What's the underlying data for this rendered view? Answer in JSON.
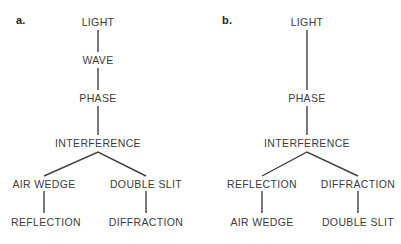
{
  "figure": {
    "type": "concept-tree-pair",
    "background_color": "#ffffff",
    "text_color": "#3c3c3c",
    "line_color": "#404040"
  },
  "panels": [
    {
      "label": "a.",
      "nodes": {
        "light": "LIGHT",
        "wave": "WAVE",
        "phase": "PHASE",
        "interference": "INTERFERENCE",
        "left_mid": "AIR WEDGE",
        "right_mid": "DOUBLE SLIT",
        "left_leaf": "REFLECTION",
        "right_leaf": "DIFFRACTION"
      }
    },
    {
      "label": "b.",
      "nodes": {
        "light": "LIGHT",
        "phase": "PHASE",
        "interference": "INTERFERENCE",
        "left_mid": "REFLECTION",
        "right_mid": "DIFFRACTION",
        "left_leaf": "AIR WEDGE",
        "right_leaf": "DOUBLE SLIT"
      }
    }
  ]
}
